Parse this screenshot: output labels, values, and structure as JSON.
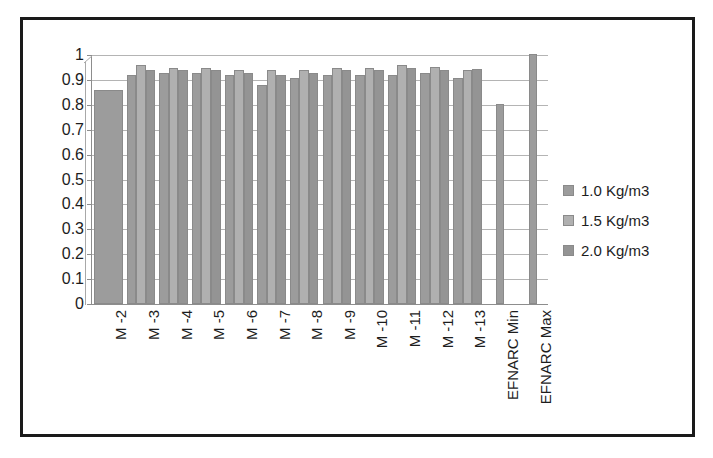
{
  "chart_data": {
    "type": "bar",
    "title": "",
    "subtitle": "",
    "xlabel": "",
    "ylabel": "",
    "ylim": [
      0,
      1
    ],
    "ytick_labels": [
      "1",
      "0.9",
      "0.8",
      "0.7",
      "0.6",
      "0.5",
      "0.4",
      "0.3",
      "0.2",
      "0.1",
      "0"
    ],
    "ytick_values": [
      1,
      0.9,
      0.8,
      0.7,
      0.6,
      0.5,
      0.4,
      0.3,
      0.2,
      0.1,
      0
    ],
    "grid": true,
    "legend_position": "right",
    "categories": [
      "M -2",
      "M -3",
      "M -4",
      "M -5",
      "M -6",
      "M -7",
      "M -8",
      "M -9",
      "M -10",
      "M -11",
      "M -12",
      "M -13",
      "EFNARC Min",
      "EFNARC Max"
    ],
    "series": [
      {
        "name": "1.0 Kg/m3",
        "color": "#9c9c9c",
        "values": [
          0.855,
          0.915,
          0.925,
          0.925,
          0.915,
          0.875,
          0.905,
          0.915,
          0.915,
          0.915,
          0.925,
          0.905,
          0.8,
          1.0
        ]
      },
      {
        "name": "1.5 Kg/m3",
        "color": "#b0b0b0",
        "values": [
          null,
          0.955,
          0.945,
          0.945,
          0.935,
          0.935,
          0.935,
          0.945,
          0.945,
          0.955,
          0.95,
          0.935,
          null,
          null
        ]
      },
      {
        "name": "2.0 Kg/m3",
        "color": "#949494",
        "values": [
          null,
          0.935,
          0.935,
          0.935,
          0.925,
          0.915,
          0.925,
          0.935,
          0.935,
          0.945,
          0.935,
          0.94,
          null,
          null
        ]
      }
    ]
  },
  "legend": {
    "entries": [
      {
        "label": "1.0 Kg/m3",
        "swatch": "series-1-swatch"
      },
      {
        "label": "1.5 Kg/m3",
        "swatch": "series-2-swatch"
      },
      {
        "label": "2.0 Kg/m3",
        "swatch": "series-3-swatch"
      }
    ]
  },
  "colors": {
    "bar_fill": "#9e9e9e",
    "bar_stroke": "#8a8a8a",
    "gridline": "#b4b4b4",
    "axis": "#8d8d8d",
    "frame": "#1a1a1a",
    "text": "#1d1d1d",
    "background": "#ffffff"
  }
}
